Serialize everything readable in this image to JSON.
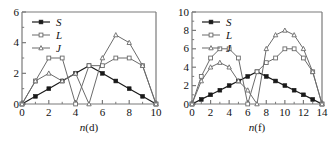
{
  "figure": {
    "panels": [
      {
        "id": "panel-d",
        "chart_data": {
          "type": "line",
          "title": "",
          "subtitle": "",
          "xlabel": "n(d)",
          "xlabel_italic_part": "n",
          "xlabel_rest": "(d)",
          "ylabel": "",
          "xlim": [
            0,
            10
          ],
          "ylim": [
            0,
            6
          ],
          "xticks": [
            0,
            2,
            4,
            6,
            8,
            10
          ],
          "xtick_labels": [
            "0",
            "2",
            "4",
            "6",
            "8",
            "10"
          ],
          "xminorticks": [
            1,
            3,
            5,
            7,
            9
          ],
          "yticks": [
            0,
            2,
            4,
            6
          ],
          "ytick_labels": [
            "0",
            "2",
            "4",
            "6"
          ],
          "yminorticks": [
            1,
            3,
            5
          ],
          "grid": false,
          "legend_position": "top-left",
          "x": [
            0,
            1,
            2,
            3,
            4,
            5,
            6,
            7,
            8,
            9,
            10
          ],
          "series": [
            {
              "name": "S",
              "marker": "filled-square",
              "color": "#1a1a1a",
              "values": [
                0,
                0.5,
                1.0,
                1.5,
                2.0,
                2.5,
                2.0,
                1.5,
                1.0,
                0.5,
                0
              ]
            },
            {
              "name": "L",
              "marker": "open-square",
              "color": "#6b6b6b",
              "values": [
                0,
                1.5,
                3.0,
                3.0,
                0,
                2.5,
                2.5,
                3.0,
                3.0,
                2.5,
                0
              ]
            },
            {
              "name": "J",
              "marker": "open-triangle",
              "color": "#6b6b6b",
              "values": [
                0,
                1.5,
                2.0,
                1.5,
                2.0,
                0,
                3.0,
                4.5,
                4.0,
                2.5,
                0
              ]
            }
          ]
        }
      },
      {
        "id": "panel-f",
        "chart_data": {
          "type": "line",
          "title": "",
          "subtitle": "",
          "xlabel": "n(f)",
          "xlabel_italic_part": "n",
          "xlabel_rest": "(f)",
          "ylabel": "",
          "xlim": [
            0,
            14
          ],
          "ylim": [
            0,
            10
          ],
          "xticks": [
            0,
            2,
            4,
            6,
            8,
            10,
            12,
            14
          ],
          "xtick_labels": [
            "0",
            "2",
            "4",
            "6",
            "8",
            "10",
            "12",
            "14"
          ],
          "xminorticks": [
            1,
            3,
            5,
            7,
            9,
            11,
            13
          ],
          "yticks": [
            0,
            2,
            4,
            6,
            8,
            10
          ],
          "ytick_labels": [
            "0",
            "2",
            "4",
            "6",
            "8",
            "10"
          ],
          "yminorticks": [
            1,
            3,
            5,
            7,
            9
          ],
          "grid": false,
          "legend_position": "top-left",
          "x": [
            0,
            1,
            2,
            3,
            4,
            5,
            6,
            7,
            8,
            9,
            10,
            11,
            12,
            13,
            14
          ],
          "series": [
            {
              "name": "S",
              "marker": "filled-square",
              "color": "#1a1a1a",
              "values": [
                0,
                0.5,
                1.0,
                1.5,
                2.0,
                2.5,
                3.0,
                3.5,
                3.0,
                2.5,
                2.0,
                1.5,
                1.0,
                0.5,
                0
              ]
            },
            {
              "name": "L",
              "marker": "open-square",
              "color": "#6b6b6b",
              "values": [
                0,
                3.0,
                5.0,
                6.0,
                6.0,
                5.0,
                0,
                3.5,
                4.5,
                5.0,
                6.0,
                6.0,
                5.0,
                3.5,
                0
              ]
            },
            {
              "name": "J",
              "marker": "open-triangle",
              "color": "#6b6b6b",
              "values": [
                0,
                2.5,
                4.0,
                4.5,
                4.0,
                2.5,
                1.5,
                0,
                6.0,
                7.5,
                8.0,
                7.5,
                6.0,
                3.5,
                0
              ]
            }
          ]
        }
      }
    ]
  }
}
